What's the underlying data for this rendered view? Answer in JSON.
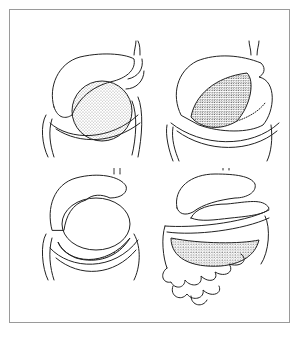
{
  "figure": {
    "kind": "anatomical line illustration",
    "layout": "2x2 grid of panels inside a thin bordered frame",
    "panels": [
      {
        "position": "top-left",
        "subject": "liver lobe reflected over stippled stomach/mass above transverse colon"
      },
      {
        "position": "top-right",
        "subject": "liver lobe with exposed dark stippled oval mass, fringed border over colon"
      },
      {
        "position": "bottom-left",
        "subject": "liver over pale round organ with dark stippled crescent below, colon frame"
      },
      {
        "position": "bottom-right",
        "subject": "liver and stomach over stippled mass with coiled small bowel loops below"
      }
    ],
    "colors": {
      "ink": "#222222",
      "frame": "#9a9a9a",
      "background": "#ffffff"
    }
  }
}
